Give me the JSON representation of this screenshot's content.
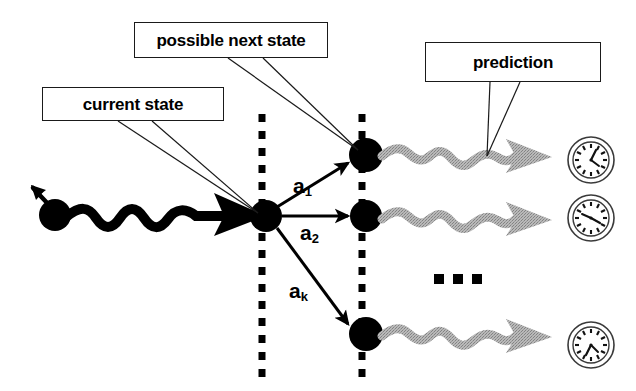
{
  "diagram": {
    "background_color": "#ffffff",
    "ink_color": "#000000",
    "wave_color": "#a8a8a8",
    "callouts": [
      {
        "id": "current-state",
        "label": "current state"
      },
      {
        "id": "possible-next",
        "label": "possible next state"
      },
      {
        "id": "prediction",
        "label": "prediction"
      }
    ],
    "action_labels": [
      {
        "id": "a1",
        "base": "a",
        "subscript": "1"
      },
      {
        "id": "a2",
        "base": "a",
        "subscript": "2"
      },
      {
        "id": "ak",
        "base": "a",
        "subscript": "k"
      }
    ],
    "ellipsis": "■ ■ ■",
    "nodes": [
      {
        "id": "past-state",
        "cx": 55,
        "cy": 215,
        "r": 16
      },
      {
        "id": "current-state",
        "cx": 266,
        "cy": 216,
        "r": 16
      },
      {
        "id": "next-state-1",
        "cx": 366,
        "cy": 155,
        "r": 17
      },
      {
        "id": "next-state-2",
        "cx": 366,
        "cy": 216,
        "r": 16
      },
      {
        "id": "next-state-k",
        "cx": 366,
        "cy": 334,
        "r": 17
      }
    ],
    "time_lines": [
      {
        "id": "time-line-current",
        "x": 262,
        "y1": 114,
        "y2": 379
      },
      {
        "id": "time-line-next",
        "x": 362,
        "y1": 114,
        "y2": 379
      }
    ],
    "clocks": [
      {
        "id": "clock-1",
        "cx": 591,
        "cy": 160,
        "r": 23,
        "hour_angle": 25,
        "minute_angle": 110
      },
      {
        "id": "clock-2",
        "cx": 591,
        "cy": 218,
        "r": 23,
        "hour_angle": 135,
        "minute_angle": 95
      },
      {
        "id": "clock-3",
        "cx": 591,
        "cy": 345,
        "r": 23,
        "hour_angle": 200,
        "minute_angle": 170
      }
    ]
  }
}
